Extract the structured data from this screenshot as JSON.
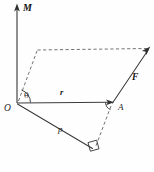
{
  "figure": {
    "type": "geometry-vector-diagram",
    "canvas": {
      "width": 154,
      "height": 172,
      "background": "#fefefe"
    },
    "colors": {
      "solid_stroke": "#3a3a3a",
      "dashed_stroke": "#6b6b6b",
      "label_text": "#1f1f1f",
      "arrow_fill": "#2f2f2f"
    },
    "labels": {
      "moment_axis": "M",
      "origin": "O",
      "angle": "θ",
      "position_vector": "r",
      "point_a": "A",
      "force_vector": "F",
      "perpendicular_distance": "p"
    },
    "label_positions": {
      "moment_axis": {
        "x": 23,
        "y": 11
      },
      "origin": {
        "x": 5,
        "y": 110
      },
      "angle": {
        "x": 25,
        "y": 97
      },
      "position_vector": {
        "x": 61,
        "y": 95
      },
      "point_a": {
        "x": 119,
        "y": 109
      },
      "force_vector": {
        "x": 133,
        "y": 79
      },
      "perpendicular_distance": {
        "x": 59,
        "y": 131
      }
    },
    "points": {
      "O": {
        "x": 17,
        "y": 103
      },
      "A": {
        "x": 113,
        "y": 102
      },
      "M_tip": {
        "x": 17,
        "y": 5
      },
      "F_tip": {
        "x": 150,
        "y": 47
      },
      "para_top_left": {
        "x": 37,
        "y": 50
      },
      "para_top_right": {
        "x": 148,
        "y": 49
      },
      "foot_perpendicular": {
        "x": 93,
        "y": 148
      }
    },
    "elements": [
      {
        "name": "moment-axis",
        "style": "solid-arrow",
        "from": "O",
        "to": "M_tip"
      },
      {
        "name": "position-vector-r",
        "style": "solid-arrow",
        "from": "O",
        "to": "A"
      },
      {
        "name": "force-vector-F",
        "style": "solid-arrow",
        "from": "A",
        "to": "F_tip"
      },
      {
        "name": "perpendicular-p",
        "style": "solid",
        "from": "O",
        "to": "foot_perpendicular"
      },
      {
        "name": "parallelogram-left-edge",
        "style": "dashed",
        "from": "O",
        "to": "para_top_left"
      },
      {
        "name": "parallelogram-top-edge",
        "style": "dashed",
        "from": "para_top_left",
        "to": "para_top_right"
      },
      {
        "name": "force-line-extension",
        "style": "dashed",
        "from": "A",
        "to": "foot_perpendicular"
      },
      {
        "name": "angle-arc-theta",
        "style": "arc",
        "at": "O"
      },
      {
        "name": "right-angle-marker",
        "style": "square",
        "at": "foot_perpendicular"
      }
    ]
  }
}
